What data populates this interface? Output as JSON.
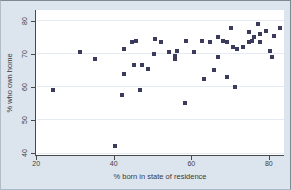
{
  "figure": {
    "background": "#dce4ed",
    "plot_background": "#ffffff",
    "marker_color": "#3b3b5c",
    "axis_color": "#4a4a4a",
    "text_color": "#3a3a3a"
  },
  "chart_data": {
    "type": "scatter",
    "title": "",
    "xlabel": "% born in state of residence",
    "ylabel": "% who own home",
    "x_ticks": [
      20,
      40,
      60,
      80
    ],
    "y_ticks": [
      40,
      50,
      60,
      70,
      80
    ],
    "xlim": [
      19.7,
      83.9
    ],
    "ylim": [
      39.1,
      83.3
    ],
    "grid": "horizontal-light",
    "legend": "none",
    "points": [
      [
        24,
        59
      ],
      [
        31,
        70.5
      ],
      [
        35,
        68.5
      ],
      [
        40,
        42
      ],
      [
        42,
        57.5
      ],
      [
        46.5,
        59
      ],
      [
        42.5,
        64
      ],
      [
        42.5,
        71.5
      ],
      [
        44.5,
        73.5
      ],
      [
        45.5,
        74
      ],
      [
        45,
        66.5
      ],
      [
        47,
        66.5
      ],
      [
        48.5,
        65.5
      ],
      [
        50,
        70
      ],
      [
        50.5,
        74.5
      ],
      [
        52,
        73.5
      ],
      [
        54,
        70.5
      ],
      [
        55.5,
        69.5
      ],
      [
        56,
        71
      ],
      [
        55.5,
        68.5
      ],
      [
        58,
        55
      ],
      [
        58.5,
        74
      ],
      [
        60.5,
        70.5
      ],
      [
        63,
        62.5
      ],
      [
        62.5,
        74
      ],
      [
        64.5,
        73.5
      ],
      [
        65.5,
        65
      ],
      [
        66.5,
        75
      ],
      [
        66.5,
        69
      ],
      [
        68,
        74
      ],
      [
        69,
        63
      ],
      [
        69,
        73.5
      ],
      [
        70,
        78
      ],
      [
        70.5,
        72
      ],
      [
        71,
        60
      ],
      [
        71.5,
        71.5
      ],
      [
        73,
        72
      ],
      [
        74.5,
        73.5
      ],
      [
        74.5,
        76.5
      ],
      [
        75.5,
        74
      ],
      [
        76,
        75
      ],
      [
        77,
        79
      ],
      [
        77.5,
        76
      ],
      [
        77.5,
        73.5
      ],
      [
        79,
        77
      ],
      [
        80,
        71
      ],
      [
        80.5,
        69
      ],
      [
        81,
        75.5
      ],
      [
        82.5,
        78
      ]
    ]
  }
}
